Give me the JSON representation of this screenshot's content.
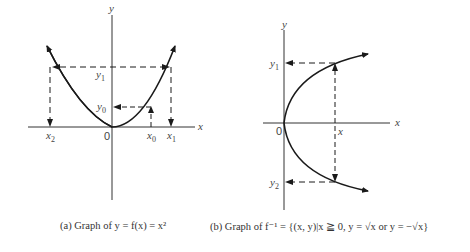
{
  "panel_a": {
    "axis_x_label": "x",
    "axis_y_label": "y",
    "origin_label": "0",
    "points": {
      "x0": {
        "var": "x",
        "sub": "0"
      },
      "x1": {
        "var": "x",
        "sub": "1"
      },
      "x2": {
        "var": "x",
        "sub": "2"
      },
      "y0": {
        "var": "y",
        "sub": "0"
      },
      "y1": {
        "var": "y",
        "sub": "1"
      }
    },
    "caption": "(a)  Graph of y = f(x) = x²"
  },
  "panel_b": {
    "axis_x_label": "x",
    "axis_y_label": "y",
    "origin_label": "0",
    "point_x_label": "x",
    "points": {
      "y1": {
        "var": "y",
        "sub": "1"
      },
      "y2": {
        "var": "y",
        "sub": "2"
      }
    },
    "caption": "(b)  Graph of f⁻¹ = {(x, y)|x ≧ 0, y = √x or y = −√x}"
  },
  "colors": {
    "line": "#1a1a1a",
    "axis": "#333333",
    "text": "#444444"
  }
}
